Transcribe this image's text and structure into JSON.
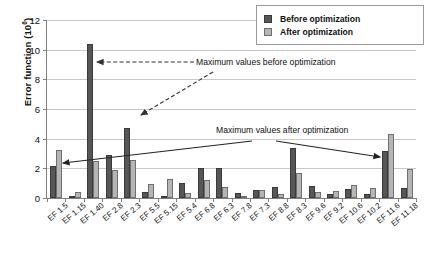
{
  "chart_data": {
    "type": "bar",
    "title": "",
    "xlabel": "",
    "ylabel": "Error function (10",
    "ylabel_exponent": "6",
    "ylabel_suffix": ")",
    "ylim": [
      0,
      12
    ],
    "yticks": [
      0,
      2,
      4,
      6,
      8,
      10,
      12
    ],
    "grid": true,
    "legend_position": "top-right",
    "categories": [
      "EF 1.5",
      "EF 1.15",
      "EF 1.40",
      "EF 2.8",
      "EF 2.3",
      "EF 5.5",
      "EF 5.15",
      "EF 5.4",
      "EF 6.8",
      "EF 6.3",
      "EF 7.8",
      "EF 7.3",
      "EF 8.8",
      "EF 8.3",
      "EF 9.6",
      "EF 9.2",
      "EF 10.6",
      "EF 10.2",
      "EF 11.6",
      "EF 11.18"
    ],
    "series": [
      {
        "name": "Before optimization",
        "color": "#565656",
        "values": [
          2.15,
          0.12,
          10.35,
          2.9,
          4.7,
          0.38,
          0.05,
          1.0,
          2.0,
          2.05,
          0.32,
          0.55,
          0.72,
          3.35,
          0.82,
          0.25,
          0.58,
          0.27,
          3.2,
          0.7
        ]
      },
      {
        "name": "After optimization",
        "color": "#b5b5b5",
        "values": [
          3.25,
          0.42,
          2.48,
          1.92,
          2.55,
          0.95,
          1.25,
          0.34,
          1.2,
          0.75,
          0.15,
          0.55,
          0.3,
          1.7,
          0.38,
          0.47,
          0.85,
          0.65,
          4.32,
          1.95
        ]
      }
    ],
    "annotations": [
      {
        "id": "max-before",
        "text": "Maximum values before optimization",
        "arrow_style": "dashed",
        "targets": [
          "EF 1.40",
          "EF 2.3"
        ]
      },
      {
        "id": "max-after",
        "text": "Maximum values after optimization",
        "arrow_style": "solid",
        "targets": [
          "EF 1.5",
          "EF 11.6"
        ]
      }
    ]
  },
  "legend": {
    "items": [
      {
        "label": "Before optimization",
        "swatch": "before"
      },
      {
        "label": "After optimization",
        "swatch": "after"
      }
    ]
  }
}
